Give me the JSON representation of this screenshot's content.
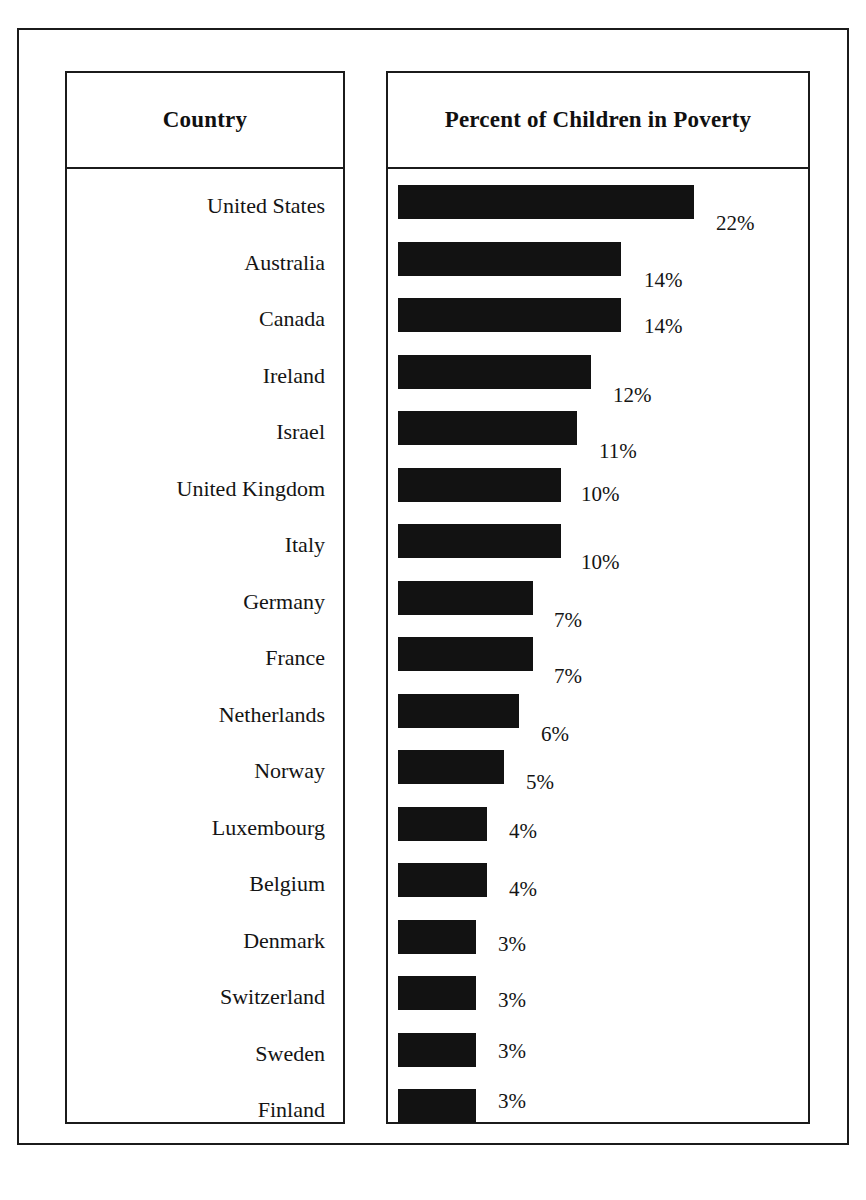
{
  "page": {
    "clipped_top_text": "",
    "frame_color": "#1b1b1b",
    "bar_color": "#121212",
    "background": "#ffffff"
  },
  "table": {
    "columns": [
      {
        "name": "country",
        "header": "Country"
      },
      {
        "name": "percent",
        "header": "Percent of Children in Poverty"
      }
    ]
  },
  "chart_data": {
    "type": "bar",
    "orientation": "horizontal",
    "title": "Percent of Children in Poverty",
    "xlabel": "",
    "ylabel": "Country",
    "grid": false,
    "legend": false,
    "value_suffix": "%",
    "categories": [
      "United States",
      "Australia",
      "Canada",
      "Ireland",
      "Israel",
      "United Kingdom",
      "Italy",
      "Germany",
      "France",
      "Netherlands",
      "Norway",
      "Luxembourg",
      "Belgium",
      "Denmark",
      "Switzerland",
      "Sweden",
      "Finland"
    ],
    "values": [
      22,
      14,
      14,
      12,
      11,
      10,
      10,
      7,
      7,
      6,
      5,
      4,
      4,
      3,
      3,
      3,
      3
    ],
    "labels": [
      "22%",
      "14%",
      "14%",
      "12%",
      "11%",
      "10%",
      "10%",
      "7%",
      "7%",
      "6%",
      "5%",
      "4%",
      "4%",
      "3%",
      "3%",
      "3%",
      "3%"
    ],
    "xlim": [
      0,
      22
    ]
  },
  "rows": [
    {
      "country": "United States",
      "value": 22,
      "label": "22%",
      "bar_w": 296,
      "value_dx": 318,
      "value_dy": 28
    },
    {
      "country": "Australia",
      "value": 14,
      "label": "14%",
      "bar_w": 223,
      "value_dx": 246,
      "value_dy": 28
    },
    {
      "country": "Canada",
      "value": 14,
      "label": "14%",
      "bar_w": 223,
      "value_dx": 246,
      "value_dy": 18
    },
    {
      "country": "Ireland",
      "value": 12,
      "label": "12%",
      "bar_w": 193,
      "value_dx": 215,
      "value_dy": 30
    },
    {
      "country": "Israel",
      "value": 11,
      "label": "11%",
      "bar_w": 179,
      "value_dx": 201,
      "value_dy": 30
    },
    {
      "country": "United Kingdom",
      "value": 10,
      "label": "10%",
      "bar_w": 163,
      "value_dx": 183,
      "value_dy": 16
    },
    {
      "country": "Italy",
      "value": 10,
      "label": "10%",
      "bar_w": 163,
      "value_dx": 183,
      "value_dy": 28
    },
    {
      "country": "Germany",
      "value": 7,
      "label": "7%",
      "bar_w": 135,
      "value_dx": 156,
      "value_dy": 29
    },
    {
      "country": "France",
      "value": 7,
      "label": "7%",
      "bar_w": 135,
      "value_dx": 156,
      "value_dy": 29
    },
    {
      "country": "Netherlands",
      "value": 6,
      "label": "6%",
      "bar_w": 121,
      "value_dx": 143,
      "value_dy": 30
    },
    {
      "country": "Norway",
      "value": 5,
      "label": "5%",
      "bar_w": 106,
      "value_dx": 128,
      "value_dy": 22
    },
    {
      "country": "Luxembourg",
      "value": 4,
      "label": "4%",
      "bar_w": 89,
      "value_dx": 111,
      "value_dy": 14
    },
    {
      "country": "Belgium",
      "value": 4,
      "label": "4%",
      "bar_w": 89,
      "value_dx": 111,
      "value_dy": 16
    },
    {
      "country": "Denmark",
      "value": 3,
      "label": "3%",
      "bar_w": 78,
      "value_dx": 100,
      "value_dy": 14
    },
    {
      "country": "Switzerland",
      "value": 3,
      "label": "3%",
      "bar_w": 78,
      "value_dx": 100,
      "value_dy": 14
    },
    {
      "country": "Sweden",
      "value": 3,
      "label": "3%",
      "bar_w": 78,
      "value_dx": 100,
      "value_dy": 8
    },
    {
      "country": "Finland",
      "value": 3,
      "label": "3%",
      "bar_w": 78,
      "value_dx": 100,
      "value_dy": 2
    }
  ],
  "layout": {
    "bar_top_start": 16,
    "bar_row_pitch": 56.5,
    "label_top_start": 26,
    "label_row_pitch": 56.5
  }
}
